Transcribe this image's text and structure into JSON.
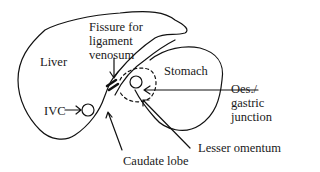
{
  "diagram": {
    "type": "anatomical-line-drawing",
    "stroke_color": "#111111",
    "background": "#ffffff"
  },
  "labels": {
    "liver": "Liver",
    "fissure_line1": "Fissure for",
    "fissure_line2": "ligament",
    "fissure_line3": "venosum",
    "stomach": "Stomach",
    "oes_line1": "Oes./",
    "oes_line2": "gastric",
    "oes_line3": "junction",
    "ivc": "IVC",
    "lesser_omentum": "Lesser omentum",
    "caudate_lobe": "Caudate lobe"
  }
}
